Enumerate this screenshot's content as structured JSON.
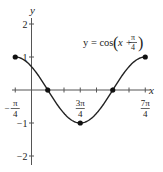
{
  "chart_data": {
    "type": "line",
    "equation": {
      "prefix": "y = cos",
      "inner_var": "x +",
      "frac_num": "π",
      "frac_den": "4"
    },
    "xlabel": "x",
    "ylabel": "y",
    "xlim_units_of_pi_over_4": [
      -1.4,
      7.4
    ],
    "ylim": [
      -2.2,
      2.4
    ],
    "x_tick_labels": [
      {
        "num": "π",
        "den": "4",
        "sign": "−",
        "value_pi_over_4": -1
      },
      {
        "num": "3π",
        "den": "4",
        "sign": "",
        "value_pi_over_4": 3
      },
      {
        "num": "7π",
        "den": "4",
        "sign": "",
        "value_pi_over_4": 7
      }
    ],
    "y_tick_labels": [
      {
        "label": "2",
        "value": 2
      },
      {
        "label": "1",
        "value": 1
      },
      {
        "label": "−1",
        "value": -1
      },
      {
        "label": "−2",
        "value": -2
      }
    ],
    "x_ticks_pi_over_4": [
      -1,
      1,
      2,
      3,
      4,
      5,
      6,
      7
    ],
    "highlighted_points": [
      {
        "x": "-π/4",
        "x_pi_over_4": -1,
        "y": 1
      },
      {
        "x": "π/4",
        "x_pi_over_4": 1,
        "y": 0
      },
      {
        "x": "3π/4",
        "x_pi_over_4": 3,
        "y": -1
      },
      {
        "x": "5π/4",
        "x_pi_over_4": 5,
        "y": 0
      },
      {
        "x": "7π/4",
        "x_pi_over_4": 7,
        "y": 1
      }
    ],
    "domain_pi_over_4": [
      -1,
      7
    ],
    "grid": false,
    "colors": {
      "curve": "#222222",
      "axis": "#555555",
      "points": "#111111"
    }
  }
}
